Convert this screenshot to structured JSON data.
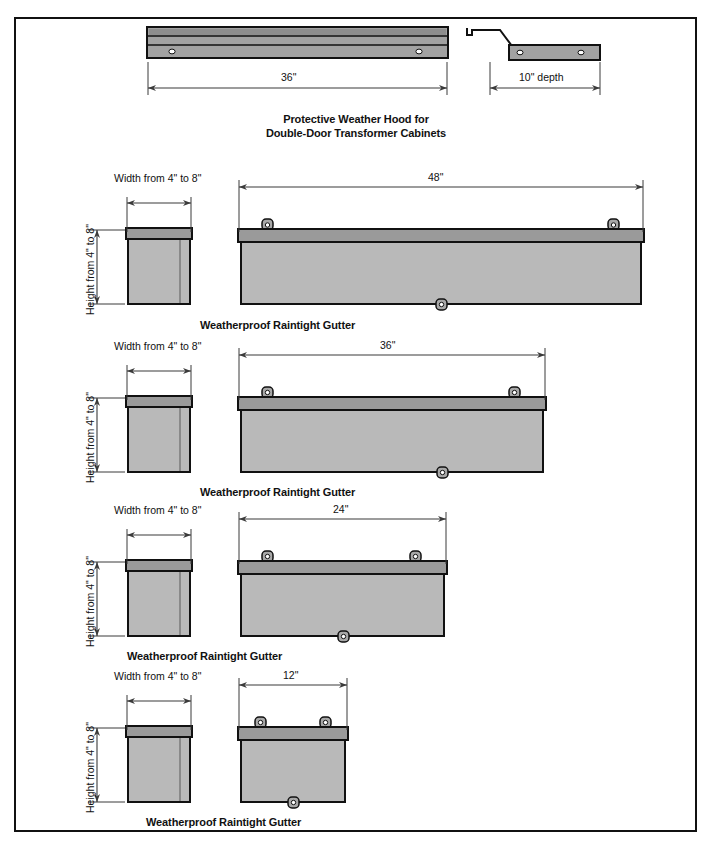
{
  "sheet": {
    "title": "Weatherproof Raintight Gutter and Weather Hood dimensional drawings",
    "border_color": "#111111",
    "background": "#ffffff"
  },
  "palette": {
    "outline": "#111111",
    "body_fill": "#b9b9b9",
    "lid_fill": "#9a9a9a",
    "hood_fill": "#a2a2a2",
    "hood_band_fill": "#8e8e8e",
    "tab_fill": "#a8a8a8",
    "dim_line": "#3a3a3a"
  },
  "figures": [
    {
      "id": "weather-hood",
      "caption_line1": "Protective Weather Hood for",
      "caption_line2": "Double-Door Transformer Cabinets",
      "front_dimension": "36\"",
      "side_dimension": "10\" depth",
      "front_holes": 2,
      "side_holes": 2
    },
    {
      "id": "gutter-48",
      "caption": "Weatherproof Raintight Gutter",
      "length_dimension": "48\"",
      "width_label": "Width from 4\" to 8\"",
      "height_label": "Height from  4\" to 8\"",
      "top_tabs": 2,
      "bottom_tabs": 1
    },
    {
      "id": "gutter-36",
      "caption": "Weatherproof Raintight Gutter",
      "length_dimension": "36\"",
      "width_label": "Width from 4\" to 8\"",
      "height_label": "Height from  4\" to 8\"",
      "top_tabs": 2,
      "bottom_tabs": 1
    },
    {
      "id": "gutter-24",
      "caption": "Weatherproof Raintight Gutter",
      "length_dimension": "24\"",
      "width_label": "Width from 4\" to 8\"",
      "height_label": "Height from  4\" to 8\"",
      "top_tabs": 2,
      "bottom_tabs": 1
    },
    {
      "id": "gutter-12",
      "caption": "Weatherproof Raintight Gutter",
      "length_dimension": "12\"",
      "width_label": "Width from 4\" to 8\"",
      "height_label": "Height from  4\" to 8\"",
      "top_tabs": 2,
      "bottom_tabs": 1
    }
  ]
}
